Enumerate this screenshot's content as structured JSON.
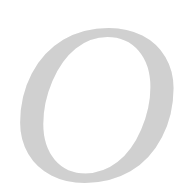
{
  "glyph": {
    "character": "O",
    "color": "#d0d0d0",
    "style": "italic serif"
  },
  "background": "#ffffff"
}
